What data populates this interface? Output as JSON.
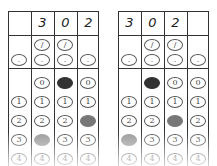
{
  "grids": [
    {
      "id": "left",
      "header": [
        "",
        "3",
        "0",
        "2"
      ],
      "slash_row": [
        false,
        true,
        true,
        false
      ],
      "decimal_row": [
        true,
        true,
        true,
        true
      ],
      "zero_row": [
        false,
        true,
        true,
        true
      ],
      "digits": [
        "0",
        "1",
        "2",
        "3",
        "4"
      ],
      "slash_label": "/",
      "decimal_label": ".",
      "filled": [
        {
          "col": 1,
          "digit": "3"
        },
        {
          "col": 2,
          "digit": "0"
        },
        {
          "col": 3,
          "digit": "2"
        }
      ]
    },
    {
      "id": "right",
      "header": [
        "3",
        "0",
        "2",
        ""
      ],
      "slash_row": [
        false,
        true,
        true,
        false
      ],
      "decimal_row": [
        true,
        true,
        true,
        true
      ],
      "zero_row": [
        false,
        true,
        true,
        true
      ],
      "digits": [
        "0",
        "1",
        "2",
        "3",
        "4"
      ],
      "slash_label": "/",
      "decimal_label": ".",
      "filled": [
        {
          "col": 0,
          "digit": "3"
        },
        {
          "col": 1,
          "digit": "0"
        },
        {
          "col": 2,
          "digit": "2"
        }
      ]
    }
  ]
}
